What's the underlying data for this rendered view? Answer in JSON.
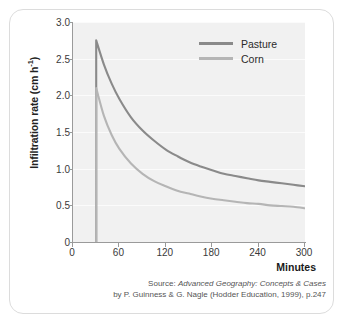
{
  "card": {
    "background": "#ffffff",
    "border_color": "#dcdcdc"
  },
  "chart_data": {
    "type": "line",
    "title": "",
    "xlabel": "Minutes",
    "ylabel": "Infiltration rate (cm h",
    "ylabel_sup": "-1",
    "ylabel_close": ")",
    "xlim": [
      0,
      300
    ],
    "ylim": [
      0,
      3.0
    ],
    "xticks": [
      0,
      60,
      120,
      180,
      240,
      300
    ],
    "xtick_labels": [
      "0",
      "60",
      "120",
      "180",
      "240",
      "300"
    ],
    "yticks": [
      0,
      0.5,
      1.0,
      1.5,
      2.0,
      2.5,
      3.0
    ],
    "ytick_labels": [
      "0",
      "0.5",
      "1.0",
      "1.5",
      "2.0",
      "2.5",
      "3.0"
    ],
    "grid": true,
    "grid_color": "#fbfbfb",
    "plot_background": "#f1f1f1",
    "legend_position": "top-right",
    "x": [
      30,
      40,
      50,
      60,
      75,
      90,
      105,
      120,
      135,
      150,
      165,
      180,
      195,
      210,
      225,
      240,
      255,
      270,
      285,
      300
    ],
    "series": [
      {
        "name": "Pasture",
        "color": "#8a8a8a",
        "values": [
          2.75,
          2.42,
          2.16,
          1.95,
          1.7,
          1.52,
          1.38,
          1.26,
          1.17,
          1.09,
          1.03,
          0.98,
          0.93,
          0.9,
          0.87,
          0.84,
          0.82,
          0.8,
          0.78,
          0.76
        ],
        "start_value_at_zero": 0.0
      },
      {
        "name": "Corn",
        "color": "#b5b5b5",
        "values": [
          2.1,
          1.72,
          1.46,
          1.27,
          1.07,
          0.93,
          0.83,
          0.76,
          0.7,
          0.66,
          0.62,
          0.59,
          0.57,
          0.55,
          0.53,
          0.52,
          0.5,
          0.49,
          0.48,
          0.46
        ],
        "start_value_at_zero": 0.0
      }
    ],
    "curve_onset_minutes": 30
  },
  "legend": {
    "items": [
      {
        "label": "Pasture",
        "color": "#8a8a8a"
      },
      {
        "label": "Corn",
        "color": "#b5b5b5"
      }
    ]
  },
  "source": {
    "line1_prefix": "Source: ",
    "line1_italic": "Advanced Geography: Concepts & Cases",
    "line2": "by P. Guinness & G. Nagle (Hodder Education, 1999), p.247"
  }
}
